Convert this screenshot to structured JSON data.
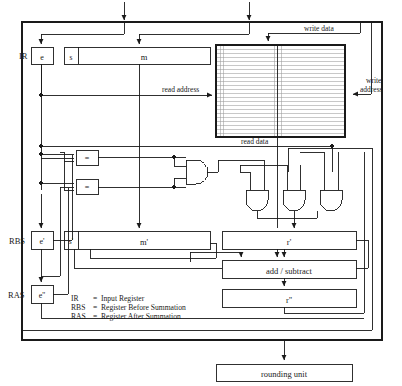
{
  "diagram": {
    "colors": {
      "line": "#1a1a1a",
      "box_fill": "#ffffff",
      "text": "#1a1a1a",
      "array_rule": "#9a9a9a",
      "background": "#ffffff"
    },
    "registers": {
      "ir": {
        "tag": "IR",
        "exponent_field": "e",
        "sign_field": "s",
        "mantissa_field": "m"
      },
      "rbs": {
        "tag": "RBS",
        "exponent_field": "e'",
        "sign_field": "s'",
        "mantissa_field": "m'"
      },
      "ras": {
        "tag": "RAS",
        "exponent_field": "e''"
      }
    },
    "blocks": {
      "memory_array": "",
      "result_register": "r'",
      "add_subtract": "add / subtract",
      "result_register_2": "r''",
      "rounding_unit": "rounding unit"
    },
    "comparators": [
      {
        "label": "="
      },
      {
        "label": "="
      }
    ],
    "gates": {
      "and_upper": "AND",
      "and_row": [
        "AND",
        "AND",
        "AND"
      ]
    },
    "bus_labels": {
      "read_address": "read address",
      "write_data": "write data",
      "write_address": "write address",
      "read_data": "read data"
    },
    "legend": [
      {
        "abbr": "IR",
        "eq": "=",
        "meaning": "Input Register"
      },
      {
        "abbr": "RBS",
        "eq": "=",
        "meaning": "Register Before Summation"
      },
      {
        "abbr": "RAS",
        "eq": "=",
        "meaning": "Register After Summation"
      }
    ]
  }
}
